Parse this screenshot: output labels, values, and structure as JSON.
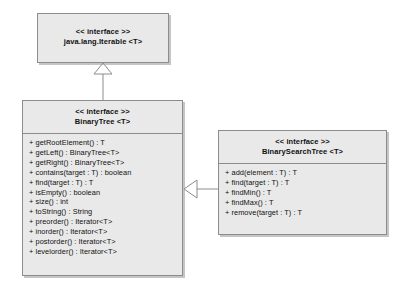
{
  "diagram": {
    "background_color": "#ffffff",
    "box_fill_color": "#e9e9e9",
    "box_border_color": "#8c8c8c",
    "line_color": "#8c8c8c"
  },
  "classes": {
    "iterable": {
      "stereotype": "<< interface >>",
      "name": "java.lang.Iterable <T>",
      "members": []
    },
    "binary_tree": {
      "stereotype": "<< interface >>",
      "name": "BinaryTree <T>",
      "members": [
        "+ getRootElement() : T",
        "+ getLeft() : BinaryTree<T>",
        "+ getRight() : BinaryTree<T>",
        "+ contains(target : T) : boolean",
        "+ find(target : T) : T",
        "+ isEmpty() : boolean",
        "+ size() : int",
        "+ toString() : String",
        "+ preorder() : Iterator<T>",
        "+ inorder() : Iterator<T>",
        "+ postorder() : Iterator<T>",
        "+ levelorder() : Iterator<T>"
      ]
    },
    "binary_search_tree": {
      "stereotype": "<< interface >>",
      "name": "BinarySearchTree <T>",
      "members": [
        "+ add(element : T) : T",
        "+ find(target : T) : T",
        "+ findMin() : T",
        "+ findMax() : T",
        "+ remove(target : T) : T"
      ]
    }
  },
  "relationships": [
    {
      "id": "binarytree-extends-iterable",
      "type": "generalization",
      "from": "BinaryTree <T>",
      "to": "java.lang.Iterable <T>",
      "arrow": "hollow-triangle"
    },
    {
      "id": "bst-extends-binarytree",
      "type": "generalization",
      "from": "BinarySearchTree <T>",
      "to": "BinaryTree <T>",
      "arrow": "hollow-triangle"
    }
  ]
}
